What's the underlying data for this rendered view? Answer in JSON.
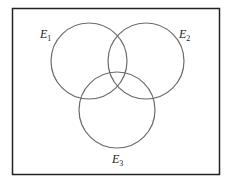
{
  "diagram": {
    "type": "venn",
    "universe": {
      "x": 12,
      "y": 8,
      "width": 207,
      "height": 166
    },
    "circles": [
      {
        "name": "E1",
        "base": "E",
        "sub": "1",
        "cx": 89,
        "cy": 61,
        "r": 38,
        "label_x": 40,
        "label_y": 38
      },
      {
        "name": "E2",
        "base": "E",
        "sub": "2",
        "cx": 146,
        "cy": 61,
        "r": 38,
        "label_x": 179,
        "label_y": 38
      },
      {
        "name": "E3",
        "base": "E",
        "sub": "3",
        "cx": 117,
        "cy": 110,
        "r": 38,
        "label_x": 112,
        "label_y": 163
      }
    ],
    "colors": {
      "border": "#222222",
      "circle": "#6a6a6a",
      "background": "#ffffff"
    }
  }
}
